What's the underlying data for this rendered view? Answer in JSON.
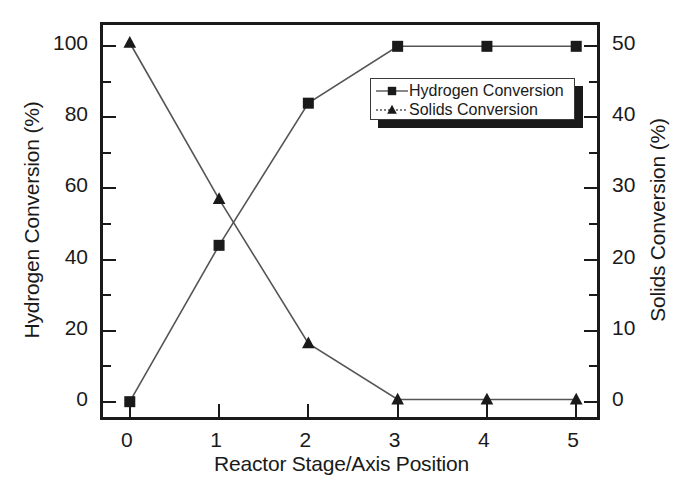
{
  "chart_data": {
    "type": "line",
    "title": "",
    "xlabel": "Reactor Stage/Axis Position",
    "ylabel": "Hydrogen Conversion (%)",
    "y2label": "Solids Conversion (%)",
    "x": [
      0,
      1,
      2,
      3,
      4,
      5
    ],
    "xlim": [
      -0.3,
      5.3
    ],
    "ylim": [
      -6,
      106
    ],
    "y2lim": [
      -3,
      53
    ],
    "xticks": [
      "0",
      "1",
      "2",
      "3",
      "4",
      "5"
    ],
    "yticks": [
      "0",
      "20",
      "40",
      "60",
      "80",
      "100"
    ],
    "y2ticks": [
      "0",
      "10",
      "20",
      "30",
      "40",
      "50"
    ],
    "y_minor_step": 10,
    "y2_minor_step": 5,
    "grid": false,
    "legend_position": "upper right",
    "series": [
      {
        "name": "Hydrogen Conversion",
        "marker": "square",
        "axis": "left",
        "values": [
          0,
          44,
          84,
          100,
          100,
          100
        ]
      },
      {
        "name": "Solids Conversion",
        "marker": "triangle",
        "axis": "right",
        "values": [
          50.5,
          28.5,
          8.2,
          0.3,
          0.3,
          0.3
        ]
      }
    ],
    "legend": [
      {
        "label": "Hydrogen Conversion",
        "marker": "square"
      },
      {
        "label": "Solids Conversion",
        "marker": "triangle"
      }
    ],
    "colors": {
      "line": "#555555",
      "marker": "#1a1a1a",
      "axis": "#1a1a1a",
      "background": "#ffffff"
    }
  }
}
